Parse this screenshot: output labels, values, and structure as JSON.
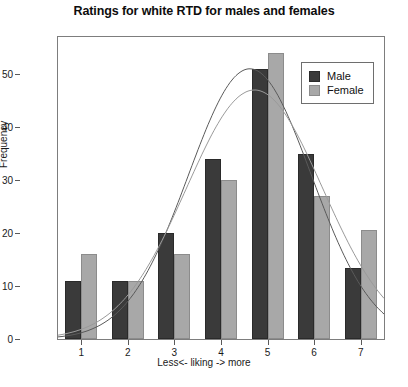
{
  "chart_data": {
    "type": "bar",
    "title": "Ratings for white RTD for males and females",
    "xlabel": "Less<- liking -> more",
    "ylabel": "Frequency",
    "categories": [
      "1",
      "2",
      "3",
      "4",
      "5",
      "6",
      "7"
    ],
    "ylim": [
      0,
      57
    ],
    "yticks": [
      0,
      10,
      20,
      30,
      40,
      50
    ],
    "grid": false,
    "legend_position": "top-right",
    "series": [
      {
        "name": "Male",
        "color": "#3a3a3a",
        "values": [
          11,
          11,
          20,
          34,
          51,
          35,
          13.5
        ]
      },
      {
        "name": "Female",
        "color": "#a8a8a8",
        "values": [
          16,
          11,
          16,
          30,
          54,
          27,
          20.5
        ]
      }
    ],
    "overlay_curves": [
      {
        "name": "Male normal curve",
        "color": "#5a5a5a",
        "peak_x": 4.62,
        "peak_y": 51,
        "sigma": 1.32
      },
      {
        "name": "Female normal curve",
        "color": "#9a9a9a",
        "peak_x": 4.72,
        "peak_y": 47,
        "sigma": 1.46
      }
    ]
  },
  "legend": {
    "items": [
      {
        "label": "Male"
      },
      {
        "label": "Female"
      }
    ]
  }
}
